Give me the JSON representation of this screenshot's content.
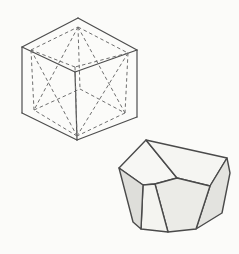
{
  "page": {
    "background_color": "#fbfbf9"
  },
  "diagram": {
    "cube_figure": {
      "description": "Cube drawn with solid edges; inscribed crystal form drawn with dashed hidden lines",
      "stroke_color": "#4d4d4d",
      "vertices": {
        "topLeft": [
          22,
          47
        ],
        "topBack": [
          78,
          18
        ],
        "topRight": [
          137,
          50
        ],
        "topFront": [
          75,
          72
        ],
        "bottomLeft": [
          22,
          113
        ],
        "bottomFront": [
          77,
          140
        ],
        "bottomRight": [
          137,
          117
        ]
      },
      "solid_edges": [
        [
          "topLeft",
          "topBack"
        ],
        [
          "topBack",
          "topRight"
        ],
        [
          "topRight",
          "topFront"
        ],
        [
          "topFront",
          "topLeft"
        ],
        [
          "topLeft",
          "bottomLeft"
        ],
        [
          "topFront",
          "bottomFront"
        ],
        [
          "topRight",
          "bottomRight"
        ],
        [
          "bottomLeft",
          "bottomFront"
        ],
        [
          "bottomFront",
          "bottomRight"
        ]
      ]
    },
    "inscribed_form": {
      "description": "Dashed crystal form inscribed in the cube: large inset square near the top face tapering to a smaller square on the bottom face",
      "stroke_color": "#6e6e6e",
      "vertices": {
        "TL": [
          31,
          50
        ],
        "TB": [
          78,
          27
        ],
        "TR": [
          128,
          53
        ],
        "TF": [
          75,
          67
        ],
        "BL": [
          34,
          110
        ],
        "BB": [
          80,
          89
        ],
        "BR": [
          125,
          113
        ],
        "BF": [
          77,
          136
        ]
      },
      "dashed_edges": [
        [
          "TL",
          "TB"
        ],
        [
          "TB",
          "TR"
        ],
        [
          "TR",
          "TF"
        ],
        [
          "TF",
          "TL"
        ],
        [
          "BL",
          "BB"
        ],
        [
          "BB",
          "BR"
        ],
        [
          "BR",
          "BF"
        ],
        [
          "BF",
          "BL"
        ],
        [
          "TL",
          "BL"
        ],
        [
          "TB",
          "BB"
        ],
        [
          "TR",
          "BR"
        ],
        [
          "TF",
          "BF"
        ],
        [
          "TL",
          "BF"
        ],
        [
          "TR",
          "BF"
        ],
        [
          "TB",
          "BL"
        ],
        [
          "TB",
          "BR"
        ]
      ]
    },
    "crystal_figure": {
      "description": "Solid shaded crystal (same form as the dashed shape), three quadrilateral faces meeting near the top, tapering trapezoidal and pentagonal faces below",
      "stroke_color": "#4a4a4a",
      "faces": [
        {
          "name": "top-left-face",
          "fill": "#f7f7f4",
          "points": [
            [
              119,
              168
            ],
            [
              146,
              140
            ],
            [
              177,
              178
            ],
            [
              155,
              184
            ],
            [
              143,
              185
            ]
          ]
        },
        {
          "name": "top-right-face",
          "fill": "#f5f5f2",
          "points": [
            [
              146,
              140
            ],
            [
              227,
              158
            ],
            [
              210,
              186
            ],
            [
              177,
              178
            ]
          ]
        },
        {
          "name": "right-face",
          "fill": "#e3e3df",
          "points": [
            [
              210,
              186
            ],
            [
              227,
              158
            ],
            [
              230,
              173
            ],
            [
              222,
              213
            ],
            [
              196,
              229
            ]
          ]
        },
        {
          "name": "front-right-face",
          "fill": "#ebebe7",
          "points": [
            [
              155,
              184
            ],
            [
              177,
              178
            ],
            [
              210,
              186
            ],
            [
              196,
              229
            ],
            [
              168,
              232
            ]
          ]
        },
        {
          "name": "front-center-face",
          "fill": "#f4f4f0",
          "points": [
            [
              143,
              185
            ],
            [
              155,
              184
            ],
            [
              168,
              232
            ],
            [
              141,
              229
            ]
          ]
        },
        {
          "name": "front-left-face",
          "fill": "#dededa",
          "points": [
            [
              119,
              168
            ],
            [
              143,
              185
            ],
            [
              141,
              229
            ],
            [
              133,
              222
            ]
          ]
        }
      ]
    }
  }
}
